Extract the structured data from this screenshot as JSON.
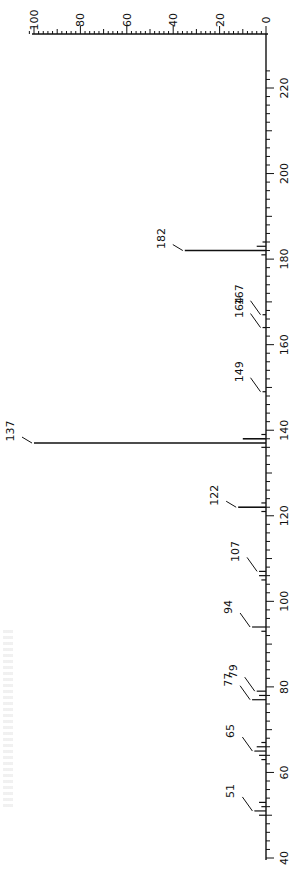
{
  "chart_data": {
    "type": "bar",
    "orientation": "rotated-90",
    "title": "",
    "xlabel": "m/z",
    "ylabel": "Relative intensity (%)",
    "x_range": [
      40,
      225
    ],
    "ylim": [
      0,
      100
    ],
    "x_ticks": [
      40,
      60,
      80,
      100,
      120,
      140,
      160,
      180,
      200,
      220
    ],
    "y_ticks": [
      0,
      20,
      40,
      60,
      80,
      100
    ],
    "grid": false,
    "peaks": [
      {
        "mz": 50,
        "intensity": 3
      },
      {
        "mz": 51,
        "intensity": 5,
        "label": "51"
      },
      {
        "mz": 52,
        "intensity": 2
      },
      {
        "mz": 53,
        "intensity": 3
      },
      {
        "mz": 63,
        "intensity": 2
      },
      {
        "mz": 64,
        "intensity": 3
      },
      {
        "mz": 65,
        "intensity": 5,
        "label": "65"
      },
      {
        "mz": 66,
        "intensity": 4
      },
      {
        "mz": 67,
        "intensity": 2
      },
      {
        "mz": 77,
        "intensity": 6,
        "label": "77"
      },
      {
        "mz": 78,
        "intensity": 3
      },
      {
        "mz": 79,
        "intensity": 4,
        "label": "79"
      },
      {
        "mz": 93,
        "intensity": 2
      },
      {
        "mz": 94,
        "intensity": 6,
        "label": "94"
      },
      {
        "mz": 105,
        "intensity": 2
      },
      {
        "mz": 106,
        "intensity": 3
      },
      {
        "mz": 107,
        "intensity": 3,
        "label": "107"
      },
      {
        "mz": 121,
        "intensity": 2
      },
      {
        "mz": 122,
        "intensity": 12,
        "label": "122"
      },
      {
        "mz": 123,
        "intensity": 2
      },
      {
        "mz": 136,
        "intensity": 2
      },
      {
        "mz": 137,
        "intensity": 100,
        "label": "137"
      },
      {
        "mz": 138,
        "intensity": 10
      },
      {
        "mz": 139,
        "intensity": 2
      },
      {
        "mz": 149,
        "intensity": 1,
        "label": "149"
      },
      {
        "mz": 164,
        "intensity": 1,
        "label": "164"
      },
      {
        "mz": 167,
        "intensity": 1,
        "label": "167"
      },
      {
        "mz": 181,
        "intensity": 2
      },
      {
        "mz": 182,
        "intensity": 35,
        "label": "182"
      },
      {
        "mz": 183,
        "intensity": 4
      },
      {
        "mz": 184,
        "intensity": 1
      }
    ]
  }
}
